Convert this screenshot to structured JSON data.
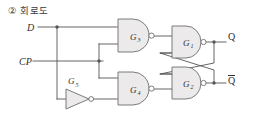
{
  "heading": {
    "marker": "②",
    "text": "회로도",
    "full": "② 회로도"
  },
  "diagram": {
    "type": "logic-circuit",
    "colors": {
      "wire": "#555555",
      "gate_stroke": "#6e6e6e",
      "gate_fill": "#eceaea",
      "text": "#2f2f2f",
      "background": "#ffffff"
    },
    "inputs": [
      {
        "name": "D",
        "label": "D"
      },
      {
        "name": "CP",
        "label": "CP"
      }
    ],
    "outputs": [
      {
        "name": "Q",
        "label": "Q",
        "overbar": false
      },
      {
        "name": "Qbar",
        "label": "Q",
        "overbar": true
      }
    ],
    "gates": [
      {
        "id": "G3",
        "label": "G",
        "subscript": "3",
        "kind": "nand",
        "position": "top-left"
      },
      {
        "id": "G4",
        "label": "G",
        "subscript": "4",
        "kind": "nand",
        "position": "bottom-left"
      },
      {
        "id": "G1",
        "label": "G",
        "subscript": "1",
        "kind": "nand",
        "position": "top-right"
      },
      {
        "id": "G2",
        "label": "G",
        "subscript": "2",
        "kind": "nand",
        "position": "bottom-right"
      },
      {
        "id": "G5",
        "label": "G",
        "subscript": "5",
        "kind": "inverter",
        "position": "bottom-left-inverter"
      }
    ]
  }
}
